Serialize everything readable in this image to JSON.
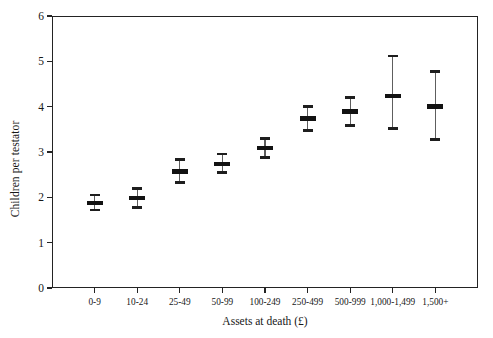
{
  "chart_data": {
    "type": "scatter",
    "title": "",
    "xlabel": "Assets at death (£)",
    "ylabel": "Children per testator",
    "categories": [
      "0-9",
      "10-24",
      "25-49",
      "50-99",
      "100-249",
      "250-499",
      "500-999",
      "1,000-1,499",
      "1,500+"
    ],
    "values": [
      1.87,
      1.98,
      2.57,
      2.74,
      3.09,
      3.74,
      3.89,
      4.24,
      4.0
    ],
    "lower": [
      1.72,
      1.78,
      2.33,
      2.55,
      2.88,
      3.48,
      3.58,
      3.52,
      3.28
    ],
    "upper": [
      2.05,
      2.2,
      2.83,
      2.96,
      3.3,
      4.0,
      4.2,
      5.12,
      4.78
    ],
    "ylim": [
      0,
      6
    ],
    "yticks": [
      0,
      1,
      2,
      3,
      4,
      5,
      6
    ],
    "ytick_labels": [
      "0",
      "1",
      "2",
      "3",
      "4",
      "5",
      "6"
    ],
    "grid": false,
    "legend": "none",
    "error_bars": "vertical capped intervals",
    "marker_style": "horizontal bar",
    "series": [
      {
        "name": "Children per testator",
        "points": [
          {
            "category": "0-9",
            "value": 1.87,
            "lower": 1.72,
            "upper": 2.05
          },
          {
            "category": "10-24",
            "value": 1.98,
            "lower": 1.78,
            "upper": 2.2
          },
          {
            "category": "25-49",
            "value": 2.57,
            "lower": 2.33,
            "upper": 2.83
          },
          {
            "category": "50-99",
            "value": 2.74,
            "lower": 2.55,
            "upper": 2.96
          },
          {
            "category": "100-249",
            "value": 3.09,
            "lower": 2.88,
            "upper": 3.3
          },
          {
            "category": "250-499",
            "value": 3.74,
            "lower": 3.48,
            "upper": 4.0
          },
          {
            "category": "500-999",
            "value": 3.89,
            "lower": 3.58,
            "upper": 4.2
          },
          {
            "category": "1,000-1,499",
            "value": 4.24,
            "lower": 3.52,
            "upper": 5.12
          },
          {
            "category": "1,500+",
            "value": 4.0,
            "lower": 3.28,
            "upper": 4.78
          }
        ]
      }
    ],
    "colors": {
      "axis": "#232323",
      "marker": "#121212",
      "whisker": "#5e5e5e",
      "cap": "#1e1e1e",
      "background": "#ffffff",
      "text": "#171717"
    }
  }
}
